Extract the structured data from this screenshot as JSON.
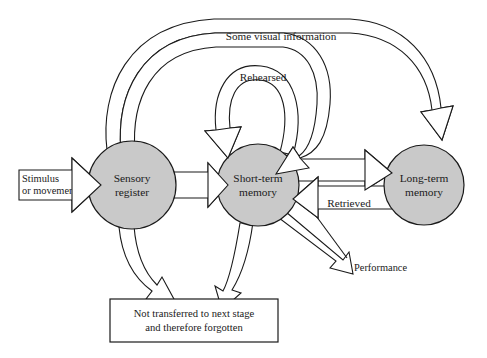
{
  "diagram": {
    "background_color": "#ffffff",
    "node_fill_color": "#c9c9c9",
    "stroke_color": "#1a1a1a",
    "band_fill_color": "#ffffff",
    "nodes": [
      {
        "id": "sensory-register",
        "line1": "Sensory",
        "line2": "register",
        "cx": 132,
        "cy": 185,
        "r": 44
      },
      {
        "id": "short-term-memory",
        "line1": "Short-term",
        "line2": "memory",
        "cx": 258,
        "cy": 185,
        "r": 41
      },
      {
        "id": "long-term-memory",
        "line1": "Long-term",
        "line2": "memory",
        "cx": 424,
        "cy": 185,
        "r": 40
      }
    ],
    "input_arrow": {
      "id": "stimulus-input",
      "line1": "Stimulus",
      "line2": "or movement"
    },
    "bottom_box": {
      "id": "forgotten-box",
      "line1": "Not transferred to next stage",
      "line2": "and therefore forgotten"
    },
    "labels": [
      {
        "id": "some-visual-information",
        "text": "Some visual information",
        "x": 281,
        "y": 40
      },
      {
        "id": "rehearsed",
        "text": "Rehearsed",
        "x": 263,
        "y": 81
      },
      {
        "id": "retrieved",
        "text": "Retrieved",
        "x": 349,
        "y": 204
      },
      {
        "id": "performance",
        "text": "Performance",
        "x": 386,
        "y": 267
      }
    ]
  }
}
